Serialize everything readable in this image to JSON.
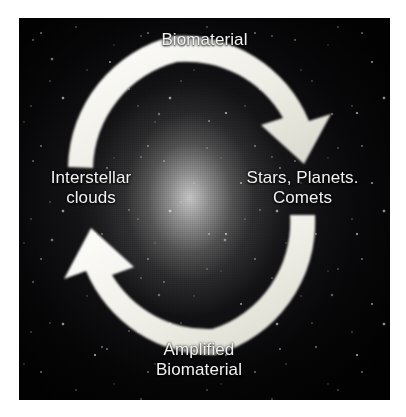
{
  "figure": {
    "kind": "cycle-diagram",
    "background_image": "galaxy-starfield-photograph",
    "arrow_color": "#f0efe8",
    "label_color": "#f2f2f2",
    "frame_color": "#ffffff",
    "photo_background_color": "#0d0d10"
  },
  "diagram": {
    "title_top": "Biomaterial",
    "nodes": [
      {
        "id": "biomaterial",
        "label": "Biomaterial",
        "position": "top"
      },
      {
        "id": "stars-planets-comets",
        "label_line1": "Stars, Planets.",
        "label_line2": "Comets",
        "position": "right"
      },
      {
        "id": "interstellar-clouds",
        "label_line1": "Interstellar",
        "label_line2": "clouds",
        "position": "left"
      },
      {
        "id": "amplified-biomaterial",
        "label_line1": "Amplified",
        "label_line2": "Biomaterial",
        "position": "bottom"
      }
    ],
    "arrows": [
      {
        "id": "arrow-clockwise-top",
        "from": "interstellar-clouds",
        "to": "stars-planets-comets",
        "direction": "clockwise",
        "carries": "Biomaterial"
      },
      {
        "id": "arrow-counterclockwise-bottom",
        "from": "stars-planets-comets",
        "to": "interstellar-clouds",
        "direction": "clockwise",
        "carries": "Amplified Biomaterial"
      }
    ]
  },
  "labels": {
    "top": "Biomaterial",
    "right_line1": "Stars, Planets.",
    "right_line2": "Comets",
    "left_line1": "Interstellar",
    "left_line2": "clouds",
    "bottom_line1": "Amplified",
    "bottom_line2": "Biomaterial"
  }
}
